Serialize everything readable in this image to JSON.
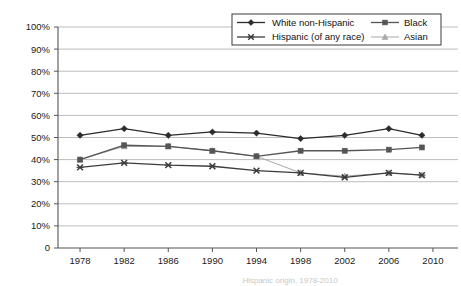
{
  "chart_data": {
    "type": "line",
    "title": "",
    "xlabel": "",
    "ylabel": "",
    "x": [
      1978,
      1982,
      1986,
      1990,
      1994,
      1998,
      2002,
      2006,
      2009
    ],
    "xlim": [
      1976,
      2012
    ],
    "ylim": [
      0,
      100
    ],
    "yticks": [
      0,
      10,
      20,
      30,
      40,
      50,
      60,
      70,
      80,
      90,
      100
    ],
    "ytick_labels": [
      "0",
      "10%",
      "20%",
      "30%",
      "40%",
      "50%",
      "60%",
      "70%",
      "80%",
      "90%",
      "100%"
    ],
    "xticks": [
      1978,
      1982,
      1986,
      1990,
      1994,
      1998,
      2002,
      2006,
      2010
    ],
    "xtick_labels": [
      "1978",
      "1982",
      "1986",
      "1990",
      "1994",
      "1998",
      "2002",
      "2006",
      "2010"
    ],
    "grid": true,
    "grid_axis": "y",
    "legend_position": "top-right",
    "series": [
      {
        "name": "White non-Hispanic",
        "marker": "diamond",
        "color": "#2b2b2b",
        "values": [
          51,
          54,
          51,
          52.5,
          52,
          49.5,
          51,
          54,
          51
        ]
      },
      {
        "name": "Black",
        "marker": "square",
        "color": "#555555",
        "values": [
          40,
          46.5,
          46,
          44,
          41.5,
          44,
          44,
          44.5,
          45.5
        ]
      },
      {
        "name": "Hispanic (of any race)",
        "marker": "x-cross",
        "color": "#3c3c3c",
        "values": [
          36.5,
          38.5,
          37.5,
          37,
          35,
          34,
          32,
          34,
          33
        ]
      },
      {
        "name": "Asian",
        "marker": "triangle",
        "color": "#a8a8a8",
        "values": [
          40,
          46,
          46,
          44,
          41.5,
          34,
          32.5,
          34,
          33
        ]
      }
    ]
  },
  "legend": {
    "entries": [
      {
        "label": "White non-Hispanic"
      },
      {
        "label": "Black"
      },
      {
        "label": "Hispanic (of any race)"
      },
      {
        "label": "Asian"
      }
    ]
  },
  "caption": {
    "text": "Hispanic origin, 1978-2010"
  },
  "colors": {
    "axis": "#555555",
    "grid": "#b5b5b5",
    "white_series": "#2b2b2b",
    "black_series": "#555555",
    "hispanic_series": "#3c3c3c",
    "asian_series": "#a8a8a8",
    "text": "#1a1a1a",
    "background": "#ffffff"
  }
}
